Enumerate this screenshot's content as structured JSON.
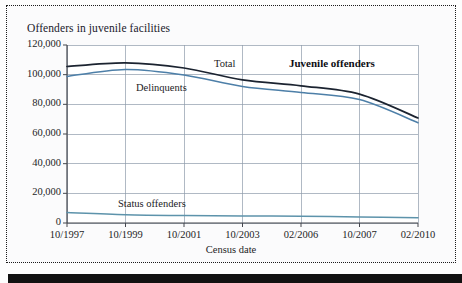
{
  "figure": {
    "axis_title": "Offenders in juvenile facilities",
    "annotation": "Juvenile offenders",
    "series_labels": {
      "total": "Total",
      "delinquents": "Delinquents",
      "status": "Status offenders"
    }
  },
  "chart_data": {
    "type": "line",
    "title": "Offenders in juvenile facilities",
    "xlabel": "Census date",
    "ylabel": "Offenders in juvenile facilities",
    "categories": [
      "10/1997",
      "10/1999",
      "10/2001",
      "10/2003",
      "02/2006",
      "10/2007",
      "02/2010"
    ],
    "ylim": [
      0,
      120000
    ],
    "yticks": [
      0,
      20000,
      40000,
      60000,
      80000,
      100000,
      120000
    ],
    "ytick_labels": [
      "0",
      "20,000",
      "40,000",
      "60,000",
      "80,000",
      "100,000",
      "120,000"
    ],
    "grid": true,
    "legend": "inline-annotations",
    "annotations": [
      "Juvenile offenders"
    ],
    "series": [
      {
        "name": "Total",
        "color": "#1b2330",
        "values": [
          105500,
          108000,
          104500,
          96500,
          92500,
          86900,
          70800
        ]
      },
      {
        "name": "Delinquents",
        "color": "#4d7fa8",
        "values": [
          98800,
          103500,
          99800,
          92000,
          88000,
          83200,
          67600
        ]
      },
      {
        "name": "Status offenders",
        "color": "#5d93ab",
        "values": [
          7000,
          5600,
          5000,
          4700,
          4600,
          4000,
          3500
        ]
      }
    ]
  },
  "colors": {
    "total": "#1b2330",
    "delinquents": "#4d7fa8",
    "status": "#5d93ab",
    "grid": "#8e9bab",
    "axis": "#44464d",
    "border": "#1c1c1c"
  }
}
